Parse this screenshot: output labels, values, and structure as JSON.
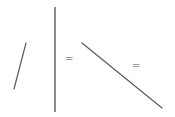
{
  "diagram": {
    "background": "#ffffff",
    "stroke_color": "#5a5a5a",
    "symbol_color": "#9a9a9a",
    "segments": [
      {
        "name": "slanted-segment",
        "x1": 26,
        "y1": 43,
        "x2": 14,
        "y2": 89,
        "width": 1.2
      },
      {
        "name": "vertical-segment",
        "x1": 55,
        "y1": 7,
        "x2": 55,
        "y2": 112,
        "width": 1.4
      },
      {
        "name": "diagonal-segment",
        "x1": 82,
        "y1": 43,
        "x2": 162,
        "y2": 108,
        "width": 1.2
      }
    ],
    "symbols": [
      {
        "name": "equals-sign-left",
        "text": "=",
        "x": 65,
        "y": 54
      },
      {
        "name": "equals-sign-right",
        "text": "=",
        "x": 132,
        "y": 61
      }
    ]
  }
}
